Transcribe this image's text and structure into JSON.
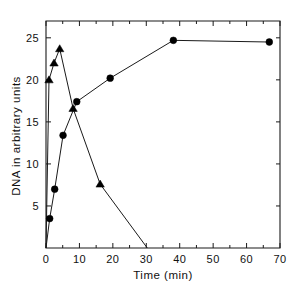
{
  "chart_data": {
    "type": "line",
    "title": "",
    "subtitle": "",
    "xlabel": "Time (min)",
    "ylabel": "DNA in arbitrary units",
    "xlim": [
      0,
      70
    ],
    "ylim": [
      0,
      27
    ],
    "grid": false,
    "legend_position": "none",
    "x_ticks": [
      0,
      10,
      20,
      30,
      40,
      50,
      60,
      70
    ],
    "x_tick_labels": [
      "0",
      "10",
      "20",
      "30",
      "40",
      "50",
      "60",
      "70"
    ],
    "x_minor_ticks": [
      5,
      15,
      25,
      35,
      45,
      55,
      65
    ],
    "y_ticks": [
      5,
      10,
      15,
      20,
      25
    ],
    "y_tick_labels": [
      "5",
      "10",
      "15",
      "20",
      "25"
    ],
    "y_minor_ticks": [],
    "series": [
      {
        "name": "circles",
        "marker": "circle",
        "points": [
          {
            "x": 0,
            "y": 0
          },
          {
            "x": 1.1,
            "y": 3.5
          },
          {
            "x": 2.6,
            "y": 7.0
          },
          {
            "x": 5.1,
            "y": 13.4
          },
          {
            "x": 9.2,
            "y": 17.4
          },
          {
            "x": 19.2,
            "y": 20.2
          },
          {
            "x": 38.1,
            "y": 24.7
          },
          {
            "x": 66.8,
            "y": 24.5
          }
        ]
      },
      {
        "name": "triangles",
        "marker": "triangle",
        "points": [
          {
            "x": 0,
            "y": 0
          },
          {
            "x": 0.9,
            "y": 20.0
          },
          {
            "x": 2.4,
            "y": 22.0
          },
          {
            "x": 4.1,
            "y": 23.7
          },
          {
            "x": 8.1,
            "y": 16.6
          },
          {
            "x": 16.2,
            "y": 7.6
          },
          {
            "x": 30.3,
            "y": 0
          }
        ]
      }
    ]
  },
  "axes": {
    "x_axis_name": "time-axis",
    "y_axis_name": "dna-axis"
  }
}
